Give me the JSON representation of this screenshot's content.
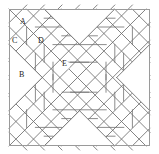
{
  "figure": {
    "canvas": {
      "width": 159,
      "height": 154
    },
    "frame": {
      "x": 9,
      "y": 9,
      "width": 141,
      "height": 137
    },
    "colors": {
      "background": "#ffffff",
      "frame_stroke": "#a0a0a0",
      "line_stroke": "#6e6e6e",
      "label_text": "#1a1a1a"
    },
    "stroke_widths": {
      "frame": 1.0,
      "lattice": 0.85,
      "detail": 0.8
    }
  },
  "labels": [
    {
      "id": "A",
      "text": "A",
      "x": 20,
      "y": 22
    },
    {
      "id": "C",
      "text": "C",
      "x": 12,
      "y": 40
    },
    {
      "id": "D",
      "text": "D",
      "x": 38,
      "y": 40
    },
    {
      "id": "B",
      "text": "B",
      "x": 19,
      "y": 74
    },
    {
      "id": "E",
      "text": "E",
      "x": 62,
      "y": 62
    }
  ],
  "geometry": {
    "cell": 17.6,
    "origin": {
      "x": 9,
      "y": 9
    },
    "grid_cols": 8,
    "grid_rows": 8,
    "note": "Diagonal lattice of 45-degree lines forming diamonds; X arms carry half-square-triangle subdivisions"
  }
}
